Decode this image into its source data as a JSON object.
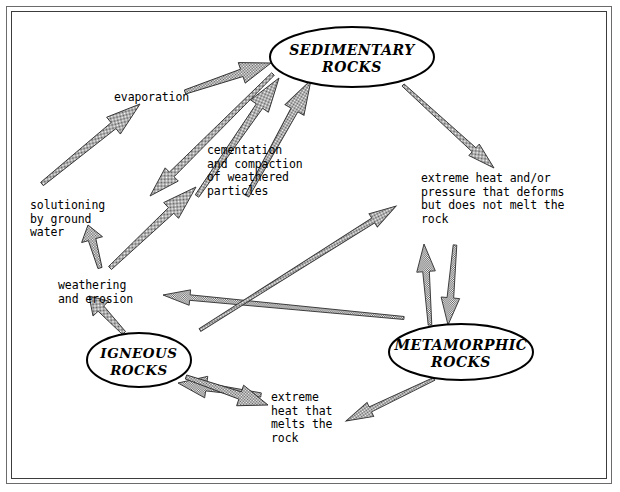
{
  "figure": {
    "kind": "rock-cycle-diagram",
    "background_color": "#ffffff",
    "ink_color": "#000000",
    "arrow_fill_color": "#808080",
    "arrow_outline_color": "#333333",
    "frame_color": "#3c3c3c"
  },
  "nodes": [
    {
      "id": "sedimentary",
      "line1": "SEDIMENTARY",
      "line2": "ROCKS",
      "cx": 352,
      "cy": 57,
      "rx": 82,
      "ry": 30
    },
    {
      "id": "metamorphic",
      "line1": "METAMORPHIC",
      "line2": "ROCKS",
      "cx": 461,
      "cy": 352,
      "rx": 72,
      "ry": 28
    },
    {
      "id": "igneous",
      "line1": "IGNEOUS",
      "line2": "ROCKS",
      "cx": 139,
      "cy": 360,
      "rx": 52,
      "ry": 27
    }
  ],
  "labels": [
    {
      "id": "evaporation",
      "text": "evaporation",
      "x": 114,
      "y": 91
    },
    {
      "id": "cementation",
      "text": "cementation\nand compaction\nof weathered\nparticles",
      "x": 207,
      "y": 144
    },
    {
      "id": "solutioning",
      "text": "solutioning\nby ground\nwater",
      "x": 30,
      "y": 199
    },
    {
      "id": "weathering",
      "text": "weathering\nand erosion",
      "x": 58,
      "y": 279
    },
    {
      "id": "extreme-heat-pressure",
      "text": "extreme heat and/or\npressure that deforms\nbut does not melt the\nrock",
      "x": 421,
      "y": 172
    },
    {
      "id": "extreme-heat-melts",
      "text": "extreme\nheat that\nmelts the\nrock",
      "x": 271,
      "y": 391
    }
  ],
  "arrows": [
    {
      "id": "solutioning-to-evaporation",
      "x1": 42,
      "y1": 184,
      "x2": 140,
      "y2": 104,
      "w": 7
    },
    {
      "id": "evaporation-to-sedimentary",
      "x1": 185,
      "y1": 92,
      "x2": 271,
      "y2": 63,
      "w": 7
    },
    {
      "id": "cementation-to-sedimentary-a",
      "x1": 197,
      "y1": 196,
      "x2": 279,
      "y2": 78,
      "w": 7
    },
    {
      "id": "cementation-to-sedimentary-b",
      "x1": 247,
      "y1": 196,
      "x2": 311,
      "y2": 80,
      "w": 7
    },
    {
      "id": "sedimentary-down-left",
      "x1": 273,
      "y1": 74,
      "x2": 150,
      "y2": 196,
      "w": 6
    },
    {
      "id": "weathering-to-cementation",
      "x1": 110,
      "y1": 268,
      "x2": 196,
      "y2": 187,
      "w": 7
    },
    {
      "id": "weathering-to-solutioning",
      "x1": 100,
      "y1": 268,
      "x2": 88,
      "y2": 225,
      "w": 7
    },
    {
      "id": "igneous-to-weathering",
      "x1": 124,
      "y1": 333,
      "x2": 89,
      "y2": 296,
      "w": 7
    },
    {
      "id": "sedimentary-to-heatpressure",
      "x1": 403,
      "y1": 85,
      "x2": 494,
      "y2": 168,
      "w": 5
    },
    {
      "id": "heatpressure-to-metamorphic",
      "x1": 455,
      "y1": 245,
      "x2": 448,
      "y2": 325,
      "w": 6
    },
    {
      "id": "metamorphic-to-heatpressure",
      "x1": 430,
      "y1": 325,
      "x2": 424,
      "y2": 244,
      "w": 6
    },
    {
      "id": "metamorphic-to-weathering",
      "x1": 404,
      "y1": 318,
      "x2": 163,
      "y2": 295,
      "w": 5
    },
    {
      "id": "igneous-to-metamorphic-region",
      "x1": 200,
      "y1": 330,
      "x2": 396,
      "y2": 206,
      "w": 5
    },
    {
      "id": "heatmelts-to-igneous",
      "x1": 261,
      "y1": 395,
      "x2": 178,
      "y2": 383,
      "w": 7
    },
    {
      "id": "igneous-to-heatmelts",
      "x1": 186,
      "y1": 377,
      "x2": 268,
      "y2": 405,
      "w": 7
    },
    {
      "id": "metamorphic-to-heatmelts",
      "x1": 434,
      "y1": 379,
      "x2": 346,
      "y2": 421,
      "w": 5
    }
  ]
}
